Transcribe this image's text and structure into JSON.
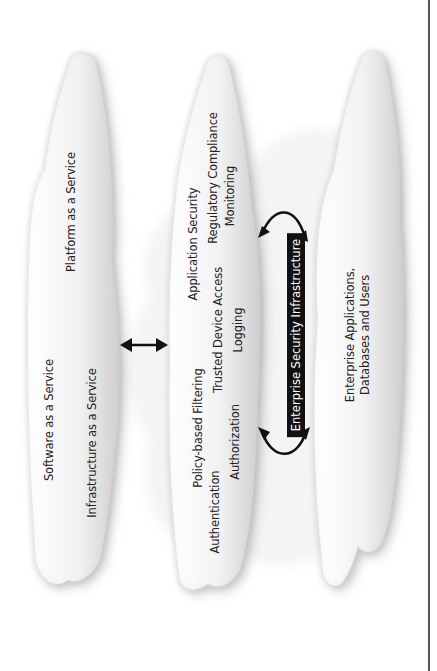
{
  "diagram": {
    "orientation": "rotated-90-ccw",
    "clouds": [
      {
        "id": "provider-cloud",
        "labels": [
          "Software as a Service",
          "Platform as a Service",
          "Infrastructure as a Service"
        ]
      },
      {
        "id": "security-cloud",
        "labels": [
          "Application Security",
          "Regulatory Compliance",
          "Monitoring",
          "Policy-based Filtering",
          "Trusted Device Access",
          "Logging",
          "Authentication",
          "Authorization"
        ]
      },
      {
        "id": "enterprise-cloud",
        "labels": [
          "Enterprise Applications, Databases and Users"
        ]
      }
    ],
    "infrastructure_label": "Enterprise Security Infrastructure",
    "connectors": [
      {
        "from": "provider-cloud",
        "to": "security-cloud",
        "type": "double-arrow-straight"
      },
      {
        "from": "security-cloud",
        "to": "enterprise-security-infrastructure",
        "type": "curved-double-arrow-top"
      },
      {
        "from": "security-cloud",
        "to": "enterprise-security-infrastructure",
        "type": "curved-double-arrow-bottom"
      }
    ],
    "colors": {
      "cloud_fill": "#f4f4f4",
      "cloud_shadow": "#9a9a9a",
      "label_box": "#111111",
      "label_box_text": "#ffffff",
      "arrow": "#111111",
      "text": "#222222"
    }
  }
}
